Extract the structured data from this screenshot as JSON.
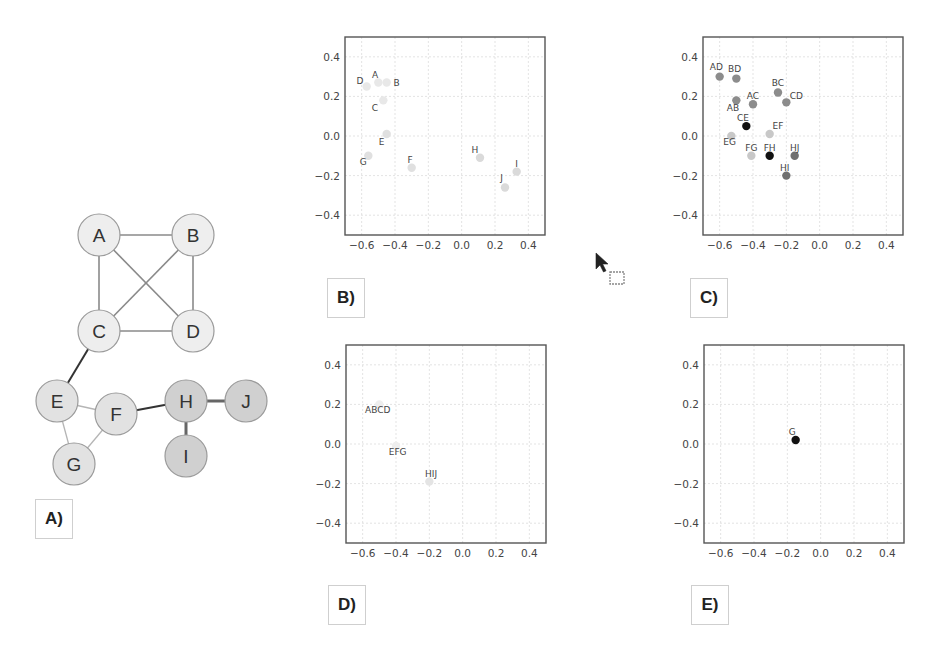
{
  "figure": {
    "panels": [
      "A)",
      "B)",
      "C)",
      "D)",
      "E)"
    ]
  },
  "graph": {
    "label": "A)",
    "nodes": [
      {
        "id": "A",
        "x": 99,
        "y": 235,
        "fill": "#eeeeee"
      },
      {
        "id": "B",
        "x": 193,
        "y": 235,
        "fill": "#eeeeee"
      },
      {
        "id": "C",
        "x": 99,
        "y": 331,
        "fill": "#eeeeee"
      },
      {
        "id": "D",
        "x": 193,
        "y": 331,
        "fill": "#eeeeee"
      },
      {
        "id": "E",
        "x": 57,
        "y": 401,
        "fill": "#e2e2e2"
      },
      {
        "id": "F",
        "x": 116,
        "y": 414,
        "fill": "#e2e2e2"
      },
      {
        "id": "G",
        "x": 74,
        "y": 464,
        "fill": "#e2e2e2"
      },
      {
        "id": "H",
        "x": 186,
        "y": 401,
        "fill": "#d0d0d0"
      },
      {
        "id": "I",
        "x": 186,
        "y": 456,
        "fill": "#d0d0d0"
      },
      {
        "id": "J",
        "x": 246,
        "y": 401,
        "fill": "#d0d0d0"
      }
    ],
    "edges": [
      {
        "from": "A",
        "to": "B",
        "color": "#8a8a8a",
        "width": 1.6
      },
      {
        "from": "A",
        "to": "C",
        "color": "#8a8a8a",
        "width": 1.6
      },
      {
        "from": "A",
        "to": "D",
        "color": "#8a8a8a",
        "width": 1.6
      },
      {
        "from": "B",
        "to": "C",
        "color": "#8a8a8a",
        "width": 1.6
      },
      {
        "from": "B",
        "to": "D",
        "color": "#8a8a8a",
        "width": 1.6
      },
      {
        "from": "C",
        "to": "D",
        "color": "#8a8a8a",
        "width": 1.6
      },
      {
        "from": "C",
        "to": "E",
        "color": "#333333",
        "width": 2
      },
      {
        "from": "E",
        "to": "F",
        "color": "#b5b5b5",
        "width": 1.3
      },
      {
        "from": "E",
        "to": "G",
        "color": "#b5b5b5",
        "width": 1.3
      },
      {
        "from": "F",
        "to": "G",
        "color": "#b5b5b5",
        "width": 1.3
      },
      {
        "from": "F",
        "to": "H",
        "color": "#333333",
        "width": 2
      },
      {
        "from": "H",
        "to": "J",
        "color": "#666666",
        "width": 3
      },
      {
        "from": "H",
        "to": "I",
        "color": "#666666",
        "width": 3
      }
    ]
  },
  "cursor": {
    "icon": "arrow-cursor-with-drag-box",
    "x": 596,
    "y": 253
  },
  "chart_data": [
    {
      "panel": "B)",
      "type": "scatter",
      "title": "",
      "xlabel": "",
      "ylabel": "",
      "xlim": [
        -0.7,
        0.5
      ],
      "ylim": [
        -0.5,
        0.5
      ],
      "xticks": [
        "-0.6",
        "-0.4",
        "-0.2",
        "0.0",
        "0.2",
        "0.4"
      ],
      "yticks": [
        "0.4",
        "0.2",
        "0.0",
        "-0.2",
        "-0.4"
      ],
      "grid": true,
      "points": [
        {
          "label": "A",
          "x": -0.5,
          "y": 0.27,
          "color": "#e8e8e8",
          "lx": -0.52,
          "ly": 0.31
        },
        {
          "label": "B",
          "x": -0.45,
          "y": 0.27,
          "color": "#e8e8e8",
          "lx": -0.39,
          "ly": 0.27
        },
        {
          "label": "C",
          "x": -0.47,
          "y": 0.18,
          "color": "#e8e8e8",
          "lx": -0.52,
          "ly": 0.14
        },
        {
          "label": "D",
          "x": -0.57,
          "y": 0.25,
          "color": "#e8e8e8",
          "lx": -0.61,
          "ly": 0.28
        },
        {
          "label": "E",
          "x": -0.45,
          "y": 0.01,
          "color": "#e0e0e0",
          "lx": -0.48,
          "ly": -0.03
        },
        {
          "label": "F",
          "x": -0.3,
          "y": -0.16,
          "color": "#e0e0e0",
          "lx": -0.31,
          "ly": -0.12
        },
        {
          "label": "G",
          "x": -0.56,
          "y": -0.1,
          "color": "#e0e0e0",
          "lx": -0.59,
          "ly": -0.13
        },
        {
          "label": "H",
          "x": 0.11,
          "y": -0.11,
          "color": "#dadada",
          "lx": 0.08,
          "ly": -0.07
        },
        {
          "label": "I",
          "x": 0.33,
          "y": -0.18,
          "color": "#dadada",
          "lx": 0.33,
          "ly": -0.14
        },
        {
          "label": "J",
          "x": 0.26,
          "y": -0.26,
          "color": "#dadada",
          "lx": 0.24,
          "ly": -0.21
        }
      ]
    },
    {
      "panel": "C)",
      "type": "scatter",
      "title": "",
      "xlabel": "",
      "ylabel": "",
      "xlim": [
        -0.7,
        0.5
      ],
      "ylim": [
        -0.5,
        0.5
      ],
      "xticks": [
        "-0.6",
        "-0.4",
        "-0.2",
        "0.0",
        "0.2",
        "0.4"
      ],
      "yticks": [
        "0.4",
        "0.2",
        "0.0",
        "-0.2",
        "-0.4"
      ],
      "grid": true,
      "points": [
        {
          "label": "AD",
          "x": -0.6,
          "y": 0.3,
          "color": "#8c8c8c",
          "lx": -0.62,
          "ly": 0.35
        },
        {
          "label": "BD",
          "x": -0.5,
          "y": 0.29,
          "color": "#8c8c8c",
          "lx": -0.51,
          "ly": 0.34
        },
        {
          "label": "BC",
          "x": -0.25,
          "y": 0.22,
          "color": "#8c8c8c",
          "lx": -0.25,
          "ly": 0.27
        },
        {
          "label": "CD",
          "x": -0.2,
          "y": 0.17,
          "color": "#8c8c8c",
          "lx": -0.14,
          "ly": 0.2
        },
        {
          "label": "AC",
          "x": -0.4,
          "y": 0.16,
          "color": "#8c8c8c",
          "lx": -0.4,
          "ly": 0.2
        },
        {
          "label": "AB",
          "x": -0.5,
          "y": 0.18,
          "color": "#8c8c8c",
          "lx": -0.52,
          "ly": 0.14
        },
        {
          "label": "CE",
          "x": -0.44,
          "y": 0.05,
          "color": "#111111",
          "lx": -0.46,
          "ly": 0.09
        },
        {
          "label": "EF",
          "x": -0.3,
          "y": 0.01,
          "color": "#c8c8c8",
          "lx": -0.25,
          "ly": 0.05
        },
        {
          "label": "EG",
          "x": -0.53,
          "y": 0.0,
          "color": "#c8c8c8",
          "lx": -0.54,
          "ly": -0.03
        },
        {
          "label": "FG",
          "x": -0.41,
          "y": -0.1,
          "color": "#c8c8c8",
          "lx": -0.41,
          "ly": -0.06
        },
        {
          "label": "FH",
          "x": -0.3,
          "y": -0.1,
          "color": "#111111",
          "lx": -0.3,
          "ly": -0.06
        },
        {
          "label": "HJ",
          "x": -0.15,
          "y": -0.1,
          "color": "#707070",
          "lx": -0.15,
          "ly": -0.06
        },
        {
          "label": "HI",
          "x": -0.2,
          "y": -0.2,
          "color": "#707070",
          "lx": -0.21,
          "ly": -0.16
        }
      ]
    },
    {
      "panel": "D)",
      "type": "scatter",
      "title": "",
      "xlabel": "",
      "ylabel": "",
      "xlim": [
        -0.7,
        0.5
      ],
      "ylim": [
        -0.5,
        0.5
      ],
      "xticks": [
        "-0.6",
        "-0.4",
        "-0.2",
        "0.0",
        "0.2",
        "0.4"
      ],
      "yticks": [
        "0.4",
        "0.2",
        "0.0",
        "-0.2",
        "-0.4"
      ],
      "grid": true,
      "points": [
        {
          "label": "ABCD",
          "x": -0.5,
          "y": 0.2,
          "color": "#eeeeee",
          "lx": -0.51,
          "ly": 0.17
        },
        {
          "label": "EFG",
          "x": -0.4,
          "y": -0.01,
          "color": "#eeeeee",
          "lx": -0.39,
          "ly": -0.04
        },
        {
          "label": "HIJ",
          "x": -0.2,
          "y": -0.19,
          "color": "#e4e4e4",
          "lx": -0.19,
          "ly": -0.15
        }
      ]
    },
    {
      "panel": "E)",
      "type": "scatter",
      "title": "",
      "xlabel": "",
      "ylabel": "",
      "xlim": [
        -0.7,
        0.5
      ],
      "ylim": [
        -0.5,
        0.5
      ],
      "xticks": [
        "-0.6",
        "-0.4",
        "-0.2",
        "0.0",
        "0.2",
        "0.4"
      ],
      "yticks": [
        "0.4",
        "0.2",
        "0.0",
        "-0.2",
        "-0.4"
      ],
      "grid": true,
      "points": [
        {
          "label": "G",
          "x": -0.15,
          "y": 0.02,
          "color": "#111111",
          "lx": -0.17,
          "ly": 0.06
        }
      ]
    }
  ]
}
